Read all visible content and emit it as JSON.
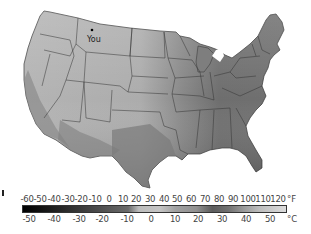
{
  "map": {
    "title": "",
    "region": "Contiguous United States",
    "style": "grayscale temperature shading",
    "marker": {
      "label": "You",
      "state": "Montana",
      "icon": "location-dot-icon"
    }
  },
  "legend": {
    "fahrenheit": {
      "unit": "°F",
      "ticks": [
        "-60",
        "-50",
        "-40",
        "-30",
        "-20",
        "-10",
        "0",
        "10",
        "20",
        "30",
        "40",
        "50",
        "60",
        "70",
        "80",
        "90",
        "100",
        "110",
        "120"
      ]
    },
    "celsius": {
      "unit": "°C",
      "ticks": [
        "-50",
        "-40",
        "-30",
        "-20",
        "-10",
        "0",
        "10",
        "20",
        "30",
        "40",
        "50"
      ]
    },
    "colors": {
      "cold": "#000000",
      "mid_light": "#c8c8c8",
      "warm": "#6a6a6a",
      "hot_light": "#d8d8d8"
    }
  },
  "shading": {
    "northwest": "#b8b8b8",
    "plains": "#a8a8a8",
    "southwest_desert": "#8a8a8a",
    "texas_south": "#7a7a7a",
    "southeast": "#6a6a6a",
    "northeast": "#9a9a9a",
    "border": "#333333"
  }
}
